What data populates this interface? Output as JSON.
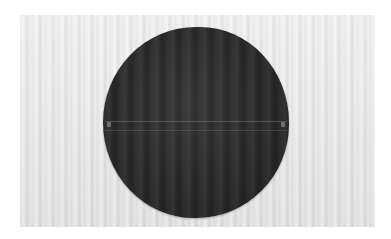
{
  "image": {
    "subject": "dark circular fabric disc with horizontal seam",
    "background": "light striped textile",
    "colors": {
      "disc": "#262626",
      "background_light": "#f4f4f4",
      "background_dark": "#dcdcdc",
      "seam": "#8a8a8a"
    }
  }
}
